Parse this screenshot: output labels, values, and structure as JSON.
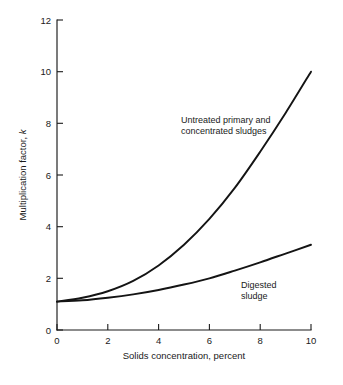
{
  "chart_data": {
    "type": "line",
    "title": "",
    "xlabel": "Solids concentration, percent",
    "ylabel": "Multiplication factor, k",
    "ylabel_plain": "Multiplication factor,",
    "ylabel_symbol": "k",
    "xlim": [
      0,
      10
    ],
    "ylim": [
      0,
      12
    ],
    "grid": false,
    "legend_position": "inline-annotations",
    "xticks": [
      0,
      2,
      4,
      6,
      8,
      10
    ],
    "xtick_labels": [
      "0",
      "2",
      "4",
      "6",
      "8",
      "10"
    ],
    "yticks": [
      0,
      2,
      4,
      6,
      8,
      10,
      12
    ],
    "ytick_labels": [
      "0",
      "2",
      "4",
      "6",
      "8",
      "10",
      "12"
    ],
    "x": [
      0,
      1,
      2,
      3,
      4,
      5,
      6,
      7,
      8,
      9,
      10
    ],
    "series": [
      {
        "name": "Untreated primary and concentrated sludges",
        "label_line_1": "Untreated primary and",
        "label_line_2": "concentrated sludges",
        "values": [
          1.1,
          1.25,
          1.5,
          1.9,
          2.5,
          3.3,
          4.3,
          5.5,
          6.9,
          8.4,
          10.0
        ],
        "color": "#141414"
      },
      {
        "name": "Digested sludge",
        "label_line_1": "Digested",
        "label_line_2": "sludge",
        "values": [
          1.1,
          1.15,
          1.25,
          1.38,
          1.55,
          1.76,
          2.0,
          2.3,
          2.62,
          2.96,
          3.3
        ],
        "color": "#141414"
      }
    ],
    "annotations": [
      {
        "id": "untreated",
        "lines": [
          "Untreated primary and",
          "concentrated sludges"
        ],
        "x_px": 181,
        "y_px": 120
      },
      {
        "id": "digested",
        "lines": [
          "Digested",
          "sludge"
        ],
        "x_px": 240,
        "y_px": 285
      }
    ],
    "axis_color": "#1a1a1a",
    "background": "#ffffff"
  }
}
